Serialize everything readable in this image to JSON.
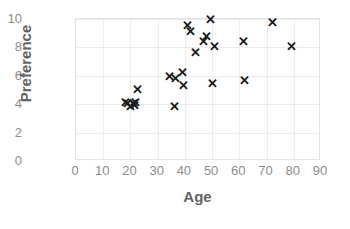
{
  "chart_data": {
    "type": "scatter",
    "title": "",
    "xlabel": "Age",
    "ylabel": "Preference",
    "xlim": [
      0,
      90
    ],
    "ylim": [
      0,
      10
    ],
    "xticks": [
      0,
      10,
      20,
      30,
      40,
      50,
      60,
      70,
      80,
      90
    ],
    "yticks": [
      0,
      2,
      4,
      6,
      8,
      10
    ],
    "grid": true,
    "legend": null,
    "marker": "x-cross",
    "marker_color": "#1a1a1a",
    "grid_color": "#ececec",
    "label_color": "#636363",
    "tick_color": "#8c8c8c",
    "points": [
      {
        "x": 18,
        "y": 4.1
      },
      {
        "x": 19,
        "y": 4.0
      },
      {
        "x": 20,
        "y": 3.8
      },
      {
        "x": 21,
        "y": 4.0
      },
      {
        "x": 21.5,
        "y": 3.9
      },
      {
        "x": 22,
        "y": 4.1
      },
      {
        "x": 22.5,
        "y": 5.0
      },
      {
        "x": 36,
        "y": 3.8
      },
      {
        "x": 34.5,
        "y": 5.9
      },
      {
        "x": 36.5,
        "y": 5.8
      },
      {
        "x": 39,
        "y": 6.2
      },
      {
        "x": 39.5,
        "y": 5.3
      },
      {
        "x": 41,
        "y": 9.5
      },
      {
        "x": 42,
        "y": 9.1
      },
      {
        "x": 44,
        "y": 7.6
      },
      {
        "x": 47,
        "y": 8.4
      },
      {
        "x": 48,
        "y": 8.7
      },
      {
        "x": 49.5,
        "y": 9.9
      },
      {
        "x": 51,
        "y": 8.0
      },
      {
        "x": 50,
        "y": 5.4
      },
      {
        "x": 61.5,
        "y": 8.4
      },
      {
        "x": 62,
        "y": 5.6
      },
      {
        "x": 72,
        "y": 9.7
      },
      {
        "x": 79,
        "y": 8.0
      }
    ]
  }
}
